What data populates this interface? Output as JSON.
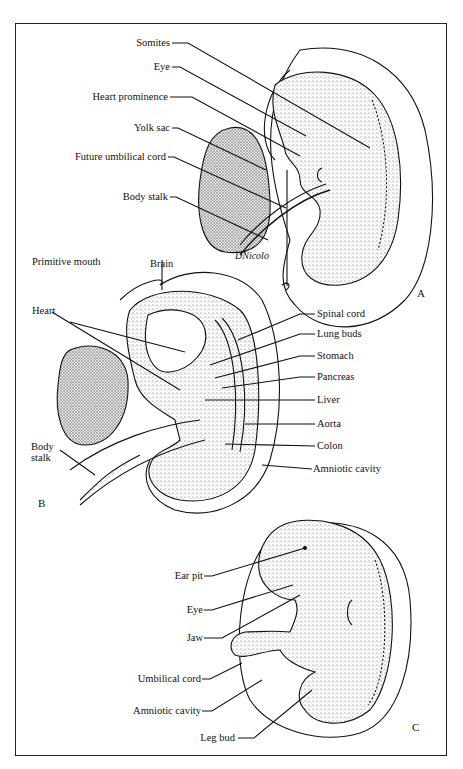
{
  "figure": {
    "panels": [
      {
        "id": "A",
        "label": "A",
        "signature": "DNicolo",
        "labels": [
          "Somites",
          "Eye",
          "Heart prominence",
          "Yolk sac",
          "Future umbilical cord",
          "Body stalk"
        ]
      },
      {
        "id": "B",
        "label": "B",
        "labels_left": [
          "Primitive mouth",
          "Brain",
          "Heart",
          "Body stalk"
        ],
        "labels_right": [
          "Spinal cord",
          "Lung buds",
          "Stomach",
          "Pancreas",
          "Liver",
          "Aorta",
          "Colon",
          "Amniotic cavity"
        ]
      },
      {
        "id": "C",
        "label": "C",
        "labels": [
          "Ear pit",
          "Eye",
          "Jaw",
          "Umbilical cord",
          "Amniotic cavity",
          "Leg bud"
        ]
      }
    ]
  },
  "A": {
    "somites": "Somites",
    "eye": "Eye",
    "heart": "Heart prominence",
    "yolk": "Yolk sac",
    "cord": "Future umbilical cord",
    "stalk": "Body stalk",
    "sig": "DNicolo",
    "panel": "A"
  },
  "B": {
    "mouth": "Primitive mouth",
    "brain": "Brain",
    "heart": "Heart",
    "stalk1": "Body",
    "stalk2": "stalk",
    "spinal": "Spinal cord",
    "lung": "Lung buds",
    "stomach": "Stomach",
    "pancreas": "Pancreas",
    "liver": "Liver",
    "aorta": "Aorta",
    "colon": "Colon",
    "amnion": "Amniotic cavity",
    "panel": "B"
  },
  "C": {
    "ear": "Ear pit",
    "eye": "Eye",
    "jaw": "Jaw",
    "cord": "Umbilical cord",
    "amnion": "Amniotic cavity",
    "leg": "Leg bud",
    "panel": "C"
  }
}
